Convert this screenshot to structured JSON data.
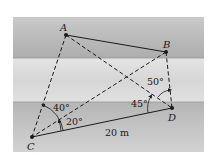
{
  "figure": {
    "points": [
      {
        "id": "A",
        "label": "A"
      },
      {
        "id": "B",
        "label": "B"
      },
      {
        "id": "C",
        "label": "C"
      },
      {
        "id": "D",
        "label": "D"
      }
    ],
    "segments": [
      {
        "from": "A",
        "to": "B",
        "style": "solid"
      },
      {
        "from": "C",
        "to": "D",
        "style": "solid"
      },
      {
        "from": "A",
        "to": "C",
        "style": "dashed"
      },
      {
        "from": "A",
        "to": "D",
        "style": "dashed"
      },
      {
        "from": "B",
        "to": "C",
        "style": "dashed"
      },
      {
        "from": "B",
        "to": "D",
        "style": "dashed"
      }
    ],
    "angles": {
      "acd_label": "40°",
      "bcd_label": "20°",
      "adc_label": "45°",
      "bda_label": "50°"
    },
    "distance_label": "20 m",
    "colors": {
      "top_band": "#b8b8b8",
      "middle_band": "#dcdcdc",
      "bottom_band": "#c2c2c2",
      "ink": "#1a1a1a"
    }
  }
}
